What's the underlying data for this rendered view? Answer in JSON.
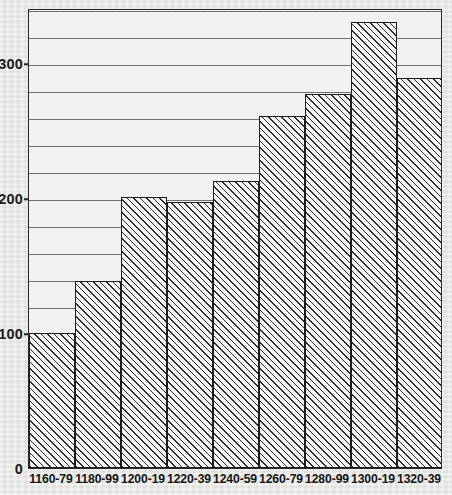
{
  "chart_data": {
    "type": "bar",
    "title": "",
    "subtitle": "",
    "xlabel": "",
    "ylabel": "",
    "categories": [
      "1160-79",
      "1180-99",
      "1200-19",
      "1220-39",
      "1240-59",
      "1260-79",
      "1280-99",
      "1300-19",
      "1320-39"
    ],
    "values": [
      100,
      139,
      201,
      197,
      213,
      261,
      277,
      331,
      289
    ],
    "ylim": [
      0,
      341
    ],
    "y_major_ticks": [
      0,
      100,
      200,
      300
    ],
    "y_major_tick_labels": [
      "0",
      "100",
      "200",
      "300"
    ],
    "y_minor_tick_interval": 20,
    "grid": true,
    "grid_axis": "y",
    "legend": null,
    "legend_position": "none",
    "bar_style": "diagonal-hatch",
    "annotations": []
  },
  "style": {
    "page_background": "#e9e9e7",
    "plot_background": "#f2f2f0",
    "frame_color": "#262626",
    "gridline_color": "#6e6e6e",
    "bar_outline_color": "#1c1c1c",
    "bar_hatch_color": "#2b2b2b",
    "label_color": "#141414"
  }
}
